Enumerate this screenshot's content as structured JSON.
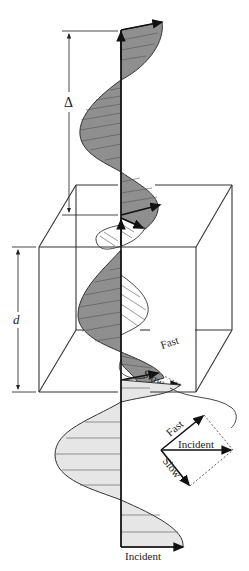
{
  "figure": {
    "colors": {
      "dark_fill": "#8f8f8f",
      "light_fill": "#e6e6e6",
      "outline": "#333333",
      "hatched_fill": "#ffffff"
    },
    "labels": {
      "retardance": "Δ",
      "thickness": "d",
      "fast_in_crystal": "Fast",
      "slow_in_crystal": "Slow",
      "vector_fast": "Fast",
      "vector_incident": "Incident",
      "vector_slow": "Slow",
      "incident_bottom": "Incident"
    },
    "components": [
      {
        "name": "incident-wave",
        "fill": "light gray",
        "position": "below crystal"
      },
      {
        "name": "fast-wave",
        "fill": "dark gray",
        "position": "through and above crystal"
      },
      {
        "name": "slow-wave",
        "fill": "white hatched",
        "position": "inside crystal"
      }
    ]
  }
}
